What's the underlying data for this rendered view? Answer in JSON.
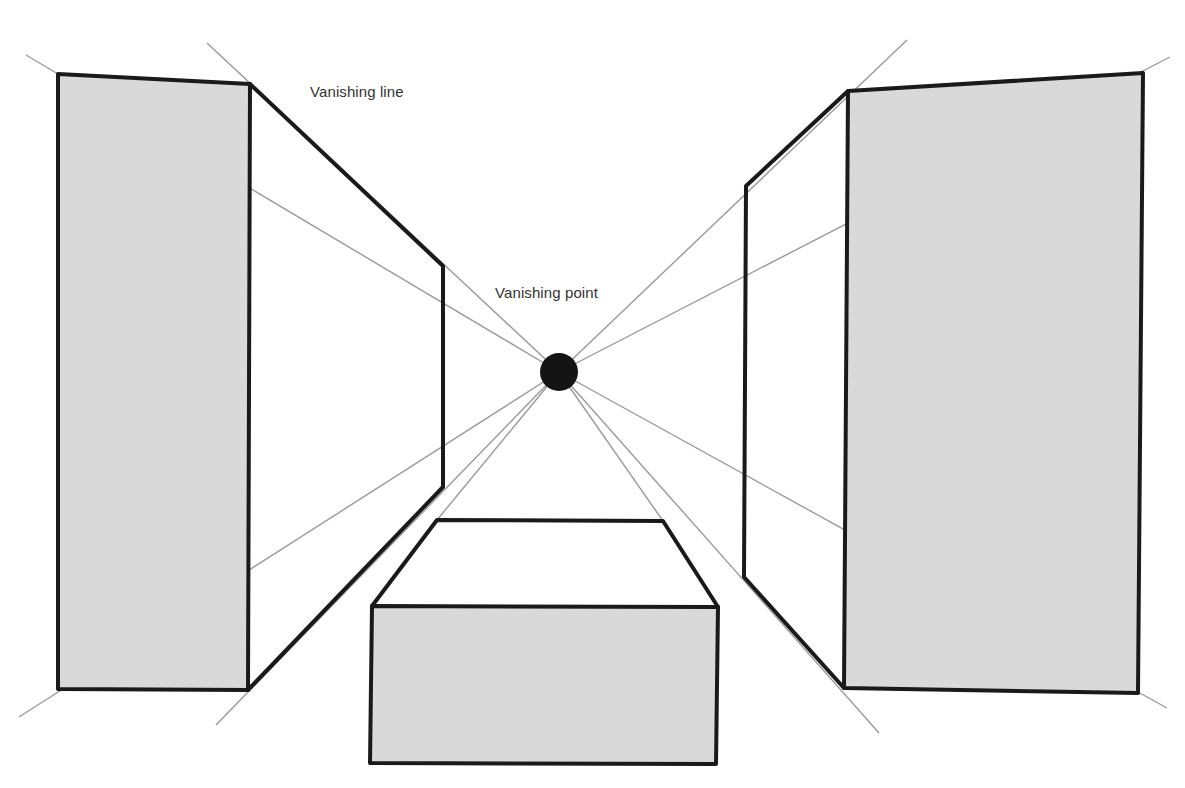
{
  "diagram": {
    "labels": {
      "vanishing_line": "Vanishing line",
      "vanishing_point": "Vanishing point"
    },
    "colors": {
      "background": "#ffffff",
      "shaded_face": "#d9d9d9",
      "outline": "#1a1a1a",
      "guide_line": "#9a9a9a",
      "vanishing_point": "#141414",
      "label_text": "#333333"
    },
    "vanishing_point": {
      "x": 559,
      "y": 372,
      "r": 19
    },
    "objects": [
      {
        "name": "left-block",
        "front_face": [
          [
            58,
            74
          ],
          [
            250,
            84
          ],
          [
            248,
            690
          ],
          [
            58,
            689
          ]
        ],
        "side_face": [
          [
            250,
            84
          ],
          [
            443,
            266
          ],
          [
            443,
            487
          ],
          [
            248,
            690
          ]
        ]
      },
      {
        "name": "right-block",
        "front_face": [
          [
            848,
            91
          ],
          [
            1143,
            73
          ],
          [
            1138,
            693
          ],
          [
            844,
            688
          ]
        ],
        "side_face": [
          [
            848,
            91
          ],
          [
            746,
            186
          ],
          [
            744,
            577
          ],
          [
            844,
            688
          ]
        ]
      },
      {
        "name": "center-box",
        "front_face": [
          [
            372,
            606
          ],
          [
            718,
            607
          ],
          [
            716,
            764
          ],
          [
            370,
            763
          ]
        ],
        "top_face": [
          [
            372,
            606
          ],
          [
            437,
            520
          ],
          [
            663,
            521
          ],
          [
            718,
            607
          ]
        ]
      }
    ],
    "guide_lines": [
      {
        "from": [
          559,
          372
        ],
        "to": [
          26,
          55
        ]
      },
      {
        "from": [
          559,
          372
        ],
        "to": [
          207,
          43
        ]
      },
      {
        "from": [
          559,
          372
        ],
        "to": [
          907,
          40
        ]
      },
      {
        "from": [
          559,
          372
        ],
        "to": [
          1170,
          57
        ]
      },
      {
        "from": [
          559,
          372
        ],
        "to": [
          19,
          717
        ]
      },
      {
        "from": [
          559,
          372
        ],
        "to": [
          216,
          725
        ]
      },
      {
        "from": [
          559,
          372
        ],
        "to": [
          879,
          733
        ]
      },
      {
        "from": [
          559,
          372
        ],
        "to": [
          1167,
          708
        ]
      },
      {
        "from": [
          559,
          372
        ],
        "to": [
          437,
          520
        ]
      },
      {
        "from": [
          559,
          372
        ],
        "to": [
          663,
          521
        ]
      }
    ]
  }
}
